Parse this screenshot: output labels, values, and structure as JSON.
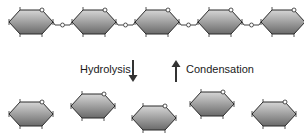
{
  "diagram": {
    "title": "",
    "top_row": {
      "description": "polymer chain of monomers joined by oxygen linkages",
      "monomers": 5,
      "linkage_label": "o",
      "ring_oxygen_label": "o"
    },
    "bottom_row": {
      "description": "separate monomers",
      "monomers": 5
    },
    "arrows": [
      {
        "id": "hydrolysis",
        "label": "Hydrolysis",
        "direction": "down"
      },
      {
        "id": "condensation",
        "label": "Condensation",
        "direction": "up"
      }
    ],
    "colors": {
      "ring_fill_light": "#c8c8c8",
      "ring_fill_dark": "#6e6e6e",
      "ring_stroke": "#2a2a2a",
      "arrow": "#333333",
      "text": "#1a1a1a"
    }
  }
}
